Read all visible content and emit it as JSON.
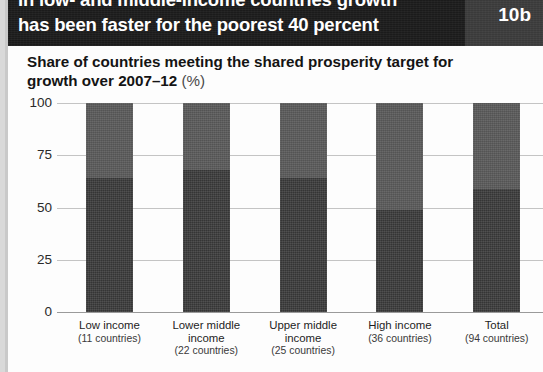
{
  "header": {
    "title_line1": "In low- and middle-income countries growth",
    "title_line2": "has been faster for the poorest 40 percent",
    "badge": "10b"
  },
  "subtitle": {
    "main": "Share of countries meeting the shared prosperity target for growth over 2007–12 ",
    "unit": "(%)"
  },
  "chart_data": {
    "type": "bar",
    "stacked": true,
    "title": "Share of countries meeting the shared prosperity target for growth over 2007–12 (%)",
    "xlabel": "",
    "ylabel": "",
    "ylim": [
      0,
      100
    ],
    "yticks": [
      "0",
      "25",
      "50",
      "75",
      "100"
    ],
    "ytick_values": [
      0,
      25,
      50,
      75,
      100
    ],
    "grid": true,
    "legend": "none",
    "categories": [
      "Low income",
      "Lower middle income",
      "Upper middle income",
      "High income",
      "Total"
    ],
    "category_sublabels": [
      "(11 countries)",
      "(22 countries)",
      "(25 countries)",
      "(36 countries)",
      "(94 countries)"
    ],
    "country_counts": [
      11,
      22,
      25,
      36,
      94
    ],
    "series": [
      {
        "name": "Meeting target",
        "color": "#3b3b3b",
        "values": [
          64,
          68,
          64,
          49,
          59
        ]
      },
      {
        "name": "Not meeting target",
        "color": "#5b5b5b",
        "values": [
          36,
          32,
          36,
          51,
          41
        ]
      }
    ]
  },
  "colors": {
    "header_band": "#1b1b1b",
    "badge": "#3a3a3a",
    "bar_lower": "#3b3b3b",
    "bar_upper": "#5b5b5b",
    "gridline": "#c4c4c4",
    "baseline": "#9a9a9a"
  }
}
